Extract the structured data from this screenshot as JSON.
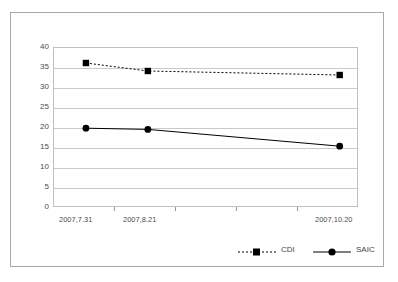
{
  "chart_data": {
    "type": "line",
    "title": "",
    "subtitle": "",
    "xlabel": "",
    "ylabel": "",
    "categories": [
      "2007,7.31",
      "2007,8.21",
      "2007,10.20"
    ],
    "series": [
      {
        "name": "CDI",
        "values": [
          36,
          34,
          33
        ],
        "marker": "square",
        "line_style": "dotted",
        "color": "#000000"
      },
      {
        "name": "SAIC",
        "values": [
          19.7,
          19.4,
          15.2
        ],
        "marker": "circle",
        "line_style": "solid",
        "color": "#000000"
      }
    ],
    "ylim": [
      0,
      40
    ],
    "yticks": [
      0,
      5,
      10,
      15,
      20,
      25,
      30,
      35,
      40
    ],
    "ytick_labels": [
      "0",
      "5",
      "10",
      "15",
      "20",
      "25",
      "30",
      "35",
      "40"
    ],
    "grid": true,
    "grid_axis": "y",
    "legend_position": "bottom-right",
    "xtick_count": 4,
    "x_positions_pct": [
      10.8,
      31.1,
      94.0
    ],
    "label_positions_pct": [
      2.0,
      23.0,
      86.0
    ]
  },
  "legend": {
    "entries": [
      {
        "label": "CDI",
        "marker": "square-marker",
        "line": "dotted-line"
      },
      {
        "label": "SAIC",
        "marker": "circle-marker",
        "line": "solid-line"
      }
    ]
  },
  "colors": {
    "plot_border": "#c0c0c0",
    "gridline": "#c9c9c9",
    "outer_frame": "#a9a9a9",
    "axis_text": "#4d4d4d",
    "series": "#000000",
    "background": "#ffffff"
  }
}
